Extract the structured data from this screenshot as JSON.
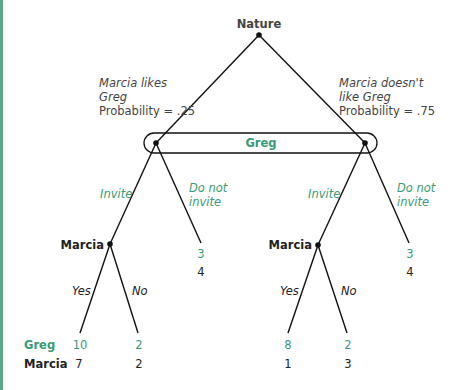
{
  "colors": {
    "accent": "#3a9a78",
    "line": "#111111",
    "text": "#222222",
    "side_bar": "#5aa88a"
  },
  "nature": {
    "label": "Nature"
  },
  "nature_branches": {
    "left": {
      "line1": "Marcia likes",
      "line2": "Greg",
      "prob": "Probability = .25"
    },
    "right": {
      "line1": "Marcia doesn't",
      "line2": "like Greg",
      "prob": "Probability = .75"
    }
  },
  "info_set": {
    "label": "Greg"
  },
  "greg_actions": {
    "left_invite": "Invite",
    "left_not_line1": "Do not",
    "left_not_line2": "invite",
    "right_invite": "Invite",
    "right_not_line1": "Do not",
    "right_not_line2": "invite"
  },
  "marcia_nodes": {
    "left": "Marcia",
    "right": "Marcia"
  },
  "marcia_actions": {
    "left_yes": "Yes",
    "left_no": "No",
    "right_yes": "Yes",
    "right_no": "No"
  },
  "payoff_row_labels": {
    "greg": "Greg",
    "marcia": "Marcia"
  },
  "payoffs": {
    "likes_invite_yes": {
      "greg": "10",
      "marcia": "7"
    },
    "likes_invite_no": {
      "greg": "2",
      "marcia": "2"
    },
    "likes_not_invite": {
      "greg": "3",
      "marcia": "4"
    },
    "dislikes_invite_yes": {
      "greg": "8",
      "marcia": "1"
    },
    "dislikes_invite_no": {
      "greg": "2",
      "marcia": "3"
    },
    "dislikes_not_invite": {
      "greg": "3",
      "marcia": "4"
    }
  }
}
